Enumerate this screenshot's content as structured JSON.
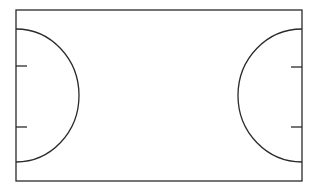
{
  "diagram": {
    "type": "court",
    "stroke_color": "#2a2a2a",
    "background": "#ffffff",
    "court": {
      "x": 16,
      "y": 10,
      "width": 286,
      "height": 171
    },
    "left_goal_area": {
      "cx": 16,
      "cy": 95.5,
      "rx": 63,
      "ry": 66.5
    },
    "right_goal_area": {
      "cx": 302,
      "cy": 95.5,
      "rx": 64,
      "ry": 66.5
    },
    "left_ticks": [
      {
        "y": 66
      },
      {
        "y": 127
      }
    ],
    "right_ticks": [
      {
        "y": 67
      },
      {
        "y": 127
      }
    ],
    "tick_length": 10
  }
}
